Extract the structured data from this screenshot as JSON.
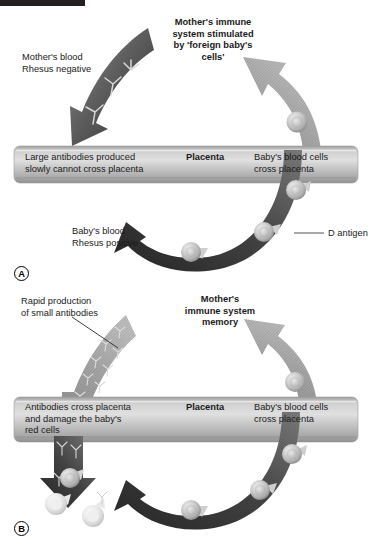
{
  "figure": {
    "title_bar": "",
    "panels": [
      {
        "id": "A",
        "letter": "A",
        "labels": {
          "mother_blood": "Mother's blood\nRhesus negative",
          "stimulated_title": "Mother's immune\nsystem stimulated\nby 'foreign baby's\ncells'",
          "bar_left": "Large antibodies produced\nslowly cannot cross placenta",
          "bar_center": "Placenta",
          "bar_right": "Baby's blood cells\ncross placenta",
          "baby_blood": "Baby's blood\nRhesus positive",
          "d_antigen": "D antigen"
        }
      },
      {
        "id": "B",
        "letter": "B",
        "labels": {
          "rapid_production": "Rapid production\nof small antibodies",
          "memory_title": "Mother's\nimmune system\nmemory",
          "bar_left": "Antibodies cross placenta\nand damage the baby's\nred cells",
          "bar_center": "Placenta",
          "bar_right": "Baby's blood cells\ncross placenta"
        }
      }
    ],
    "colors": {
      "dark_arrow": "#3f3f3f",
      "mid_arrow": "#6e6e6e",
      "light_arrow": "#a8a8a8",
      "placenta_bar": "#bdbdbd",
      "cell_body": "#c9c9c9",
      "damaged_cell": "#e2e2e2",
      "text": "#1a1a1a",
      "black_bar": "#231f20"
    },
    "icons": {
      "antibody": "antibody-y-icon",
      "red_cell": "red-blood-cell-icon",
      "damaged_cell": "damaged-red-cell-icon"
    }
  }
}
